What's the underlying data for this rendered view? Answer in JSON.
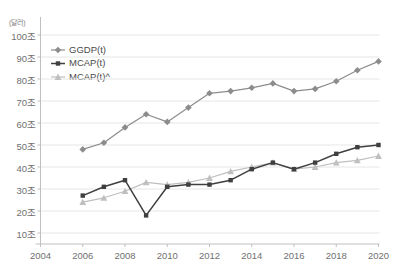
{
  "chart_data": {
    "type": "line",
    "title": "",
    "subtitle": "",
    "unit_label": "(달러)",
    "xlabel": "",
    "ylabel": "",
    "xlim": [
      2004,
      2020
    ],
    "ylim": [
      0,
      100
    ],
    "grid": true,
    "legend_position": "top-left",
    "x": [
      2006,
      2007,
      2008,
      2009,
      2010,
      2011,
      2012,
      2013,
      2014,
      2015,
      2016,
      2017,
      2018,
      2019,
      2020
    ],
    "x_ticks": [
      "2004",
      "2006",
      "2008",
      "2010",
      "2012",
      "2014",
      "2016",
      "2018",
      "2020"
    ],
    "x_tick_values": [
      2004,
      2006,
      2008,
      2010,
      2012,
      2014,
      2016,
      2018,
      2020
    ],
    "y_ticks": [
      "10조",
      "20조",
      "30조",
      "40조",
      "50조",
      "60조",
      "70조",
      "80조",
      "90조",
      "100조"
    ],
    "y_tick_values": [
      10,
      20,
      30,
      40,
      50,
      60,
      70,
      80,
      90,
      100
    ],
    "series": [
      {
        "name": "GGDP(t)",
        "color": "#8c8c8c",
        "marker": "diamond",
        "values": [
          48,
          51,
          58,
          64,
          60.5,
          67,
          73.5,
          74.5,
          76,
          78,
          74.5,
          75.5,
          79,
          84,
          88
        ]
      },
      {
        "name": "MCAP(t)",
        "color": "#3f3f3f",
        "marker": "square",
        "values": [
          27,
          31,
          34,
          18,
          31,
          32,
          32,
          34,
          39,
          42,
          39,
          42,
          46,
          49,
          50
        ]
      },
      {
        "name": "MCAP(t)^",
        "color": "#bfbfbf",
        "marker": "triangle",
        "values": [
          24,
          26,
          29,
          33,
          32,
          33,
          35,
          38,
          40,
          42,
          39,
          40,
          42,
          43,
          45
        ]
      }
    ]
  },
  "legend": {
    "items": [
      {
        "label": "GGDP(t)"
      },
      {
        "label": "MCAP(t)"
      },
      {
        "label": "MCAP(t)^"
      }
    ]
  },
  "colors": {
    "series_1": "#8c8c8c",
    "series_2": "#3f3f3f",
    "series_3": "#bfbfbf",
    "grid": "#e6e6e6",
    "axis": "#c0c0c0",
    "tick_text": "#707070"
  }
}
